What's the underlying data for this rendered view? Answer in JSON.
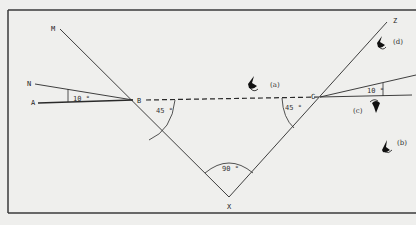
{
  "diagram": {
    "type": "reflection-path-diagram",
    "points": {
      "M": "M",
      "N": "N",
      "A": "A",
      "B": "B",
      "C": "C",
      "Z": "Z",
      "X": "X"
    },
    "angles": {
      "left_small": "10 °",
      "left_45": "45 °",
      "bottom_90": "90 °",
      "right_45": "45 °",
      "right_small": "10 °"
    },
    "captions": {
      "a": "(a)",
      "b": "(b)",
      "c": "(c)",
      "d": "(d)"
    },
    "icons": [
      "fly-icon-a",
      "fly-icon-b",
      "fly-icon-c",
      "fly-icon-d"
    ],
    "colors": {
      "background": "#efefed",
      "line": "#2a2a2a",
      "frame": "#3a3a3a"
    }
  }
}
